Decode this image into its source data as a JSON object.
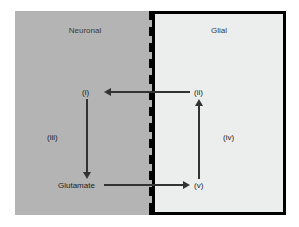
{
  "figure": {
    "compartments": {
      "neuronal": {
        "title": "Neuronal",
        "fill_color": "#b4b4b4"
      },
      "glial": {
        "title": "Glial",
        "fill_color": "#eceded",
        "border_color": "#000000"
      }
    },
    "membrane": {
      "name": "membrane-boundary",
      "color": "#000000",
      "style": "notched"
    },
    "labels": {
      "step_i": "(i)",
      "step_ii": "(ii)",
      "step_iii": "(iii)",
      "step_iv": "(iv)",
      "step_v": "(v)",
      "glutamate": "Glutamate"
    },
    "arrows": [
      {
        "name": "arrow-glial-to-neuron",
        "direction": "left",
        "from": "(ii)",
        "to": "(i)",
        "color": "#333333"
      },
      {
        "name": "arrow-neuron-down",
        "direction": "down",
        "from": "(i)",
        "to": "Glutamate",
        "color": "#333333"
      },
      {
        "name": "arrow-neuron-to-glial",
        "direction": "right",
        "from": "Glutamate",
        "to": "(v)",
        "color": "#333333"
      },
      {
        "name": "arrow-glial-up",
        "direction": "up",
        "from": "(v)",
        "to": "(ii)",
        "color": "#333333"
      }
    ]
  }
}
